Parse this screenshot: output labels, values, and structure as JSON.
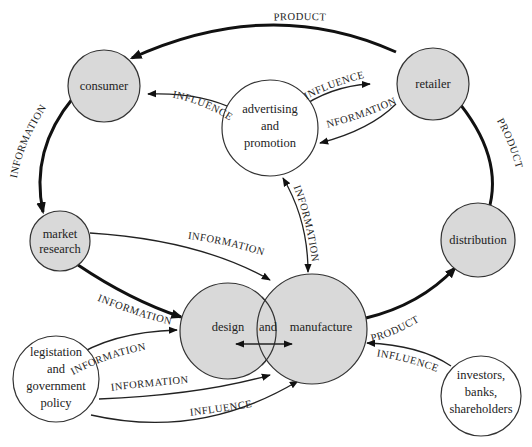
{
  "diagram": {
    "type": "flow-diagram",
    "nodes": {
      "consumer": {
        "label": "consumer",
        "style": "shaded"
      },
      "retailer": {
        "label": "retailer",
        "style": "shaded"
      },
      "advertising": {
        "lines": [
          "advertising",
          "and",
          "promotion"
        ],
        "style": "white"
      },
      "market_research": {
        "lines": [
          "market",
          "research"
        ],
        "style": "shaded"
      },
      "distribution": {
        "label": "distribution",
        "style": "shaded"
      },
      "design": {
        "label": "design",
        "style": "shaded"
      },
      "and_word": {
        "label": "and"
      },
      "manufacture": {
        "label": "manufacture",
        "style": "shaded"
      },
      "legislation": {
        "lines": [
          "legistation",
          "and",
          "government",
          "policy"
        ],
        "style": "white"
      },
      "investors": {
        "lines": [
          "investors,",
          "banks,",
          "shareholders"
        ],
        "style": "white"
      }
    },
    "edges": {
      "retailer_consumer": "PRODUCT",
      "consumer_market_research": "INFORMATION",
      "advertising_consumer": "INFLUENCE",
      "advertising_retailer": "INFLUENCE",
      "retailer_advertising": "INFORMATION",
      "distribution_retailer": "PRODUCT",
      "advertising_manufacture": "INFORMATION",
      "market_research_manufacture": "INFORMATION",
      "market_research_design": "INFORMATION",
      "manufacture_distribution": "PRODUCT",
      "investors_manufacture": "INFLUENCE",
      "legislation_design": "INFORMATION",
      "legislation_manufacture_info": "INFORMATION",
      "legislation_manufacture_influence": "INFLUENCE"
    },
    "colors": {
      "node_fill": "#d9d9d9",
      "stroke": "#222222",
      "background": "#ffffff"
    }
  }
}
